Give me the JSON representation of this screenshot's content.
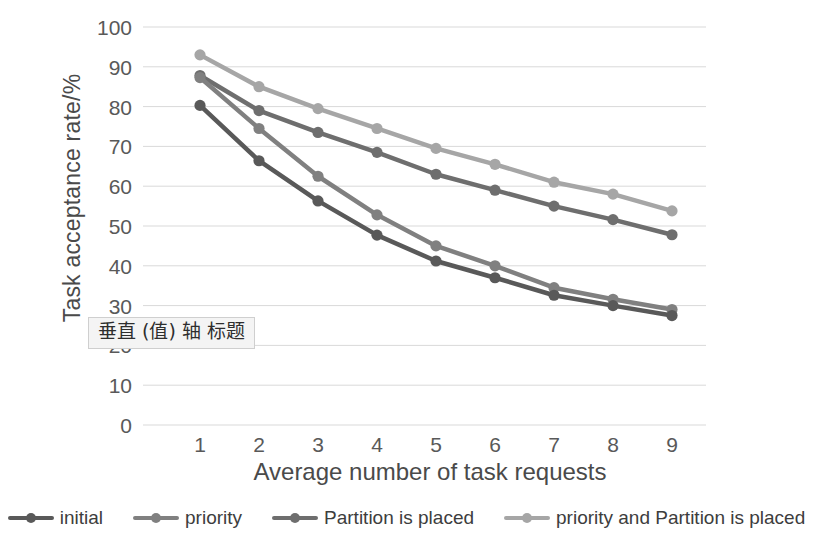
{
  "chart_data": {
    "type": "line",
    "title": "",
    "xlabel": "Average number of task requests",
    "ylabel": "Task acceptance rate/%",
    "x": [
      1,
      2,
      3,
      4,
      5,
      6,
      7,
      8,
      9
    ],
    "categories": [
      "1",
      "2",
      "3",
      "4",
      "5",
      "6",
      "7",
      "8",
      "9"
    ],
    "xlim": [
      1,
      9
    ],
    "ylim": [
      0,
      100
    ],
    "ytick_labels": [
      "0",
      "10",
      "20",
      "30",
      "40",
      "50",
      "60",
      "70",
      "80",
      "90",
      "100"
    ],
    "yticks": [
      0,
      10,
      20,
      30,
      40,
      50,
      60,
      70,
      80,
      90,
      100
    ],
    "grid": "horizontal",
    "legend_position": "bottom",
    "series": [
      {
        "name": "initial",
        "color": "#595959",
        "values": [
          80.3,
          66.4,
          56.3,
          47.7,
          41.2,
          37.0,
          32.6,
          30.0,
          27.5
        ]
      },
      {
        "name": "priority",
        "color": "#808080",
        "values": [
          87.3,
          74.5,
          62.5,
          52.8,
          45.0,
          40.0,
          34.5,
          31.6,
          29.0
        ]
      },
      {
        "name": "Partition is placed",
        "color": "#6e6e6e",
        "values": [
          87.8,
          79.0,
          73.5,
          68.5,
          63.0,
          59.0,
          55.0,
          51.6,
          47.8
        ]
      },
      {
        "name": "priority and Partition is placed",
        "color": "#a6a6a6",
        "values": [
          93.0,
          85.0,
          79.5,
          74.5,
          69.5,
          65.5,
          61.0,
          58.0,
          53.8
        ]
      }
    ]
  },
  "overlay": {
    "vertical_axis_title_tip": "垂直 (值) 轴 标题"
  },
  "colors": {
    "gridline": "#d9d9d9",
    "text": "#4a4a4a",
    "background": "#ffffff"
  }
}
